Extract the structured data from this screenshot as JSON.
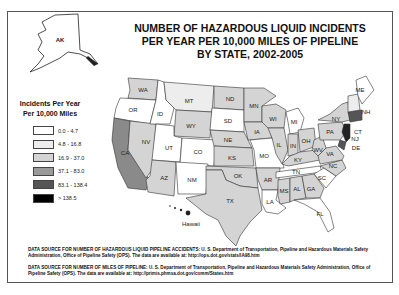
{
  "title": {
    "line1": "NUMBER OF HAZARDOUS LIQUID INCIDENTS",
    "line2": "PER YEAR PER 10,000 MILES OF PIPELINE",
    "line3": "BY STATE, 2002-2005"
  },
  "legend": {
    "title_line1": "Incidents Per Year",
    "title_line2": "Per 10,000 Miles",
    "items": [
      {
        "label": "0.0 - 4.7",
        "color": "#ffffff"
      },
      {
        "label": "4.8 - 16.8",
        "color": "#ededed"
      },
      {
        "label": "16.9 - 37.0",
        "color": "#d4d4d4"
      },
      {
        "label": "37.1 - 83.0",
        "color": "#9a9a9a"
      },
      {
        "label": "83.1 - 138.4",
        "color": "#555555"
      },
      {
        "label": "> 138.5",
        "color": "#000000"
      }
    ]
  },
  "insets": {
    "alaska": "AK",
    "hawaii": "Hawaii"
  },
  "states": {
    "WA": "WA",
    "OR": "OR",
    "CA": "CA",
    "ID": "ID",
    "NV": "NV",
    "MT": "MT",
    "WY": "WY",
    "UT": "UT",
    "AZ": "AZ",
    "CO": "CO",
    "NM": "NM",
    "ND": "ND",
    "SD": "SD",
    "NE": "NE",
    "KS": "KS",
    "OK": "OK",
    "TX": "TX",
    "MN": "MN",
    "IA": "IA",
    "MO": "MO",
    "AR": "AR",
    "LA": "LA",
    "WI": "WI",
    "IL": "IL",
    "MI": "MI",
    "IN": "IN",
    "OH": "OH",
    "KY": "KY",
    "TN": "TN",
    "MS": "MS",
    "AL": "AL",
    "GA": "GA",
    "FL": "FL",
    "SC": "SC",
    "NC": "NC",
    "VA": "VA",
    "WV": "WV",
    "PA": "PA",
    "NY": "NY",
    "ME": "ME",
    "NH": "NH",
    "CT": "CT",
    "NJ": "NJ",
    "DE": "DE"
  },
  "sources": {
    "incidents": "DATA SOURCE FOR NUMBER OF HAZARDOUS LIQUID PIPELINE ACCIDENTS: U. S. Department of Transportation, Pipeline and Hazardous Materials Safety Administration, Office of Pipeline Safety (OPS). The data are available at: http://ops.dot.gov/stats/IA98.htm",
    "miles": "DATA SOURCE FOR NUMBER OF MILES OF PIPELINE: U. S. Department of Transportation, Pipeline and Hazardous Materials Safety Administration, Office of Pipeline Safety (OPS). The data are available at: http://primis.phmsa.dot.gov/comm/States.htm"
  }
}
